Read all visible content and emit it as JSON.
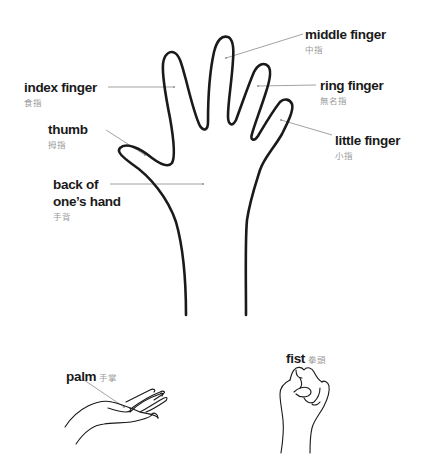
{
  "colors": {
    "outline": "#1a1a1a",
    "leader": "#8a8a8a",
    "english": "#1a1a1a",
    "chinese": "#9a9a9a"
  },
  "labels": {
    "middle_finger": {
      "en": "middle finger",
      "zh": "中指"
    },
    "index_finger": {
      "en": "index finger",
      "zh": "食指"
    },
    "ring_finger": {
      "en": "ring finger",
      "zh": "無名指"
    },
    "thumb": {
      "en": "thumb",
      "zh": "拇指"
    },
    "little_finger": {
      "en": "little finger",
      "zh": "小指"
    },
    "back_of_hand": {
      "en_line1": "back of",
      "en_line2": "one’s hand",
      "zh": "手背"
    },
    "palm": {
      "en": "palm",
      "zh": "手掌"
    },
    "fist": {
      "en": "fist",
      "zh": "拳頭"
    }
  }
}
